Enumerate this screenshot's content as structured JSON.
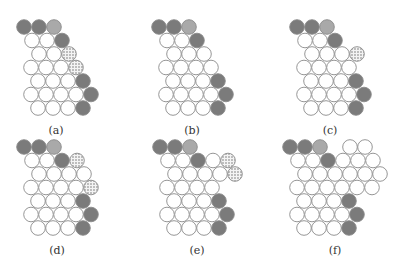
{
  "figure": {
    "circle_radius": 7.3,
    "dx": 15,
    "dy": 13.5,
    "row_x_starts": [
      24,
      32,
      39,
      31,
      38,
      31,
      38
    ],
    "colors": {
      "dark": "#7b7b7b",
      "light": "#a9a9a9",
      "white": "#ffffff",
      "dotted": "#ededed"
    },
    "legend_codes": {
      "D": "dark",
      "L": "light",
      "W": "white",
      "S": "dotted",
      ".": "empty"
    },
    "panels": [
      {
        "id": "a",
        "label": "(a)",
        "origin": [
          0,
          0
        ],
        "label_pos": [
          56,
          124
        ],
        "rows": [
          "DDL",
          "WWD",
          "WWS",
          "WWWS",
          "WWWD",
          "WWWWD",
          "WWWD"
        ]
      },
      {
        "id": "b",
        "label": "(b)",
        "origin": [
          135,
          0
        ],
        "label_pos": [
          192,
          124
        ],
        "rows": [
          "DDL",
          "WWD",
          "WWW",
          "WWWW",
          "WWWD",
          "WWWWD",
          "WWWD"
        ]
      },
      {
        "id": "c",
        "label": "(c)",
        "origin": [
          273,
          0
        ],
        "label_pos": [
          330,
          124
        ],
        "rows": [
          "DDL",
          "WWD",
          "WWWS",
          "WWWW",
          "WWWD",
          "WWWWD",
          "WWWD"
        ]
      },
      {
        "id": "d",
        "label": "(d)",
        "origin": [
          0,
          120
        ],
        "label_pos": [
          57,
          244
        ],
        "rows": [
          "DDL",
          "WWDS",
          "WWWW",
          "WWWWS",
          "WWWD",
          "WWWWD",
          "WWWD"
        ]
      },
      {
        "id": "e",
        "label": "(e)",
        "origin": [
          136,
          120
        ],
        "label_pos": [
          197,
          244
        ],
        "rows": [
          "DDL",
          "WWDWS",
          "WWWWS",
          "WWWW",
          "WWWD",
          "WWWWD",
          "WWWD"
        ]
      },
      {
        "id": "f",
        "label": "(f)",
        "origin": [
          266,
          120
        ],
        "label_pos": [
          335,
          244
        ],
        "rows": [
          "DDL.WW",
          "WWDWWW",
          "WWWWWW",
          "WWWWWW",
          "WWWD",
          "WWWWD",
          "WWWD"
        ]
      }
    ]
  }
}
